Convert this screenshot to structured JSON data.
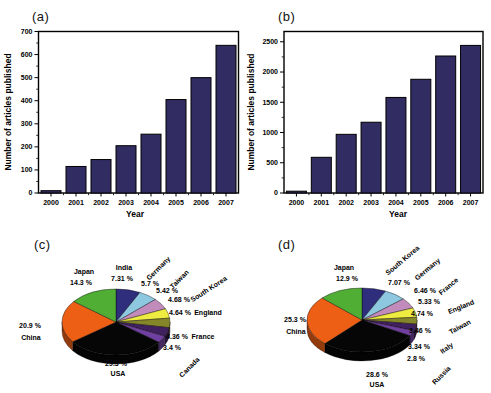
{
  "panel_letters": {
    "a": "(a)",
    "b": "(b)",
    "c": "(c)",
    "d": "(d)"
  },
  "chart_data": [
    {
      "type": "bar",
      "panel": "a",
      "categories": [
        "2000",
        "2001",
        "2002",
        "2003",
        "2004",
        "2005",
        "2006",
        "2007"
      ],
      "values": [
        10,
        115,
        145,
        205,
        255,
        405,
        500,
        640
      ],
      "xlabel": "Year",
      "ylabel": "Number of articles published",
      "ylim": [
        0,
        700
      ],
      "yticks": [
        0,
        100,
        200,
        300,
        400,
        500,
        600,
        700
      ],
      "yminor": 50,
      "bar_color": "#312d63",
      "layout": {
        "left": 38.5,
        "right": 238.5,
        "top": 31.5,
        "bottom": 193,
        "axis_max": 700,
        "ylabel_x": 11,
        "ylabel_y": 112,
        "xlabel_x": 135,
        "xlabel_y": 217
      }
    },
    {
      "type": "bar",
      "panel": "b",
      "categories": [
        "2000",
        "2001",
        "2002",
        "2003",
        "2004",
        "2005",
        "2006",
        "2007"
      ],
      "values": [
        30,
        590,
        970,
        1170,
        1580,
        1880,
        2265,
        2440
      ],
      "xlabel": "Year",
      "ylabel": "Number of articles published",
      "ylim": [
        0,
        2500
      ],
      "yticks": [
        0,
        500,
        1000,
        1500,
        2000,
        2500
      ],
      "yminor": 250,
      "bar_color": "#312d63",
      "layout": {
        "left": 284,
        "right": 483,
        "top": 31.5,
        "bottom": 193,
        "axis_max": 2670,
        "ylabel_x": 254,
        "ylabel_y": 112,
        "xlabel_x": 398,
        "xlabel_y": 217
      }
    },
    {
      "type": "pie",
      "panel": "c",
      "slices": [
        {
          "name": "India",
          "pct": "7.31 %",
          "value": 7.31,
          "color": "#2e2e7d",
          "name_x": 124,
          "name_y": 270,
          "name_rot": 0,
          "pct_x": 122,
          "pct_y": 281
        },
        {
          "name": "Germany",
          "pct": "5.7 %",
          "value": 5.7,
          "color": "#8ec8e0",
          "name_x": 160,
          "name_y": 270,
          "name_rot": -45,
          "pct_x": 150,
          "pct_y": 286
        },
        {
          "name": "Taiwan",
          "pct": "5.42 %",
          "value": 5.42,
          "color": "#c18cbc",
          "name_x": 181,
          "name_y": 281,
          "name_rot": -45,
          "pct_x": 167,
          "pct_y": 293
        },
        {
          "name": "South Korea",
          "pct": "4.68 %",
          "value": 4.68,
          "color": "#eeec40",
          "name_x": 210,
          "name_y": 291,
          "name_rot": -33,
          "pct_x": 179,
          "pct_y": 302
        },
        {
          "name": "England",
          "pct": "4.64 %",
          "value": 4.64,
          "color": "#85852a",
          "name_x": 208,
          "name_y": 315,
          "name_rot": 0,
          "pct_x": 180,
          "pct_y": 315
        },
        {
          "name": "France",
          "pct": "4.36 %",
          "value": 4.36,
          "color": "#41205f",
          "name_x": 203,
          "name_y": 339,
          "name_rot": 0,
          "pct_x": 177,
          "pct_y": 339
        },
        {
          "name": "Canada",
          "pct": "3.4 %",
          "value": 3.4,
          "color": "#7040a0",
          "name_x": 191,
          "name_y": 369,
          "name_rot": -45,
          "pct_x": 172,
          "pct_y": 350
        },
        {
          "name": "USA",
          "pct": "29.3 %",
          "value": 29.3,
          "color": "#060606",
          "name_x": 118,
          "name_y": 376,
          "name_rot": 0,
          "pct_x": 116,
          "pct_y": 366
        },
        {
          "name": "China",
          "pct": "20.9 %",
          "value": 20.9,
          "color": "#ee5f16",
          "name_x": 31,
          "name_y": 340,
          "name_rot": 0,
          "pct_x": 30,
          "pct_y": 328
        },
        {
          "name": "Japan",
          "pct": "14.3 %",
          "value": 14.3,
          "color": "#50ae35",
          "name_x": 84,
          "name_y": 274,
          "name_rot": 0,
          "pct_x": 81,
          "pct_y": 285
        }
      ],
      "layout": {
        "cx": 116,
        "cy": 322,
        "rx": 54,
        "ry": 33,
        "depth": 9
      }
    },
    {
      "type": "pie",
      "panel": "d",
      "slices": [
        {
          "name": "South Korea",
          "pct": "7.07 %",
          "value": 7.07,
          "color": "#2e2e7d",
          "name_x": 404,
          "name_y": 262,
          "name_rot": -40,
          "pct_x": 399,
          "pct_y": 285
        },
        {
          "name": "Germany",
          "pct": "6.46 %",
          "value": 6.46,
          "color": "#8ec8e0",
          "name_x": 429,
          "name_y": 271,
          "name_rot": -40,
          "pct_x": 425,
          "pct_y": 293
        },
        {
          "name": "France",
          "pct": "5.33 %",
          "value": 5.33,
          "color": "#c18cbc",
          "name_x": 450,
          "name_y": 288,
          "name_rot": -40,
          "pct_x": 429,
          "pct_y": 304
        },
        {
          "name": "England",
          "pct": "4.74 %",
          "value": 4.74,
          "color": "#eeec40",
          "name_x": 462,
          "name_y": 309,
          "name_rot": -22,
          "pct_x": 422,
          "pct_y": 316
        },
        {
          "name": "Taiwan",
          "pct": "3.46 %",
          "value": 3.46,
          "color": "#85852a",
          "name_x": 461,
          "name_y": 329,
          "name_rot": -28,
          "pct_x": 420,
          "pct_y": 333
        },
        {
          "name": "Italy",
          "pct": "3.34 %",
          "value": 3.34,
          "color": "#41205f",
          "name_x": 448,
          "name_y": 350,
          "name_rot": -35,
          "pct_x": 419,
          "pct_y": 349
        },
        {
          "name": "Russia",
          "pct": "2.8 %",
          "value": 2.8,
          "color": "#7040a0",
          "name_x": 443,
          "name_y": 377,
          "name_rot": -45,
          "pct_x": 416,
          "pct_y": 361
        },
        {
          "name": "USA",
          "pct": "28.6 %",
          "value": 28.6,
          "color": "#060606",
          "name_x": 377,
          "name_y": 387,
          "name_rot": 0,
          "pct_x": 377,
          "pct_y": 377
        },
        {
          "name": "China",
          "pct": "25.3 %",
          "value": 25.3,
          "color": "#ee5f16",
          "name_x": 296,
          "name_y": 334,
          "name_rot": 0,
          "pct_x": 295,
          "pct_y": 322
        },
        {
          "name": "Japan",
          "pct": "12.9 %",
          "value": 12.9,
          "color": "#50ae35",
          "name_x": 344,
          "name_y": 270,
          "name_rot": 0,
          "pct_x": 347,
          "pct_y": 281
        }
      ],
      "layout": {
        "cx": 362,
        "cy": 320,
        "rx": 55,
        "ry": 32,
        "depth": 9
      }
    }
  ]
}
